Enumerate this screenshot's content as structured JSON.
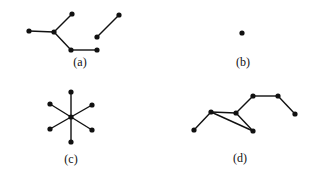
{
  "figure": {
    "panels": [
      {
        "id": "a",
        "label": "(a)",
        "label_pos": [
          80,
          66
        ],
        "nodes": [
          [
            29,
            31
          ],
          [
            54,
            32
          ],
          [
            72,
            14
          ],
          [
            71,
            50
          ],
          [
            97,
            50
          ],
          [
            97,
            37
          ],
          [
            119,
            15
          ]
        ],
        "edges": [
          [
            0,
            1
          ],
          [
            1,
            2
          ],
          [
            1,
            3
          ],
          [
            3,
            4
          ],
          [
            5,
            6
          ]
        ]
      },
      {
        "id": "b",
        "label": "(b)",
        "label_pos": [
          243,
          66
        ],
        "nodes": [
          [
            242,
            33
          ]
        ],
        "edges": []
      },
      {
        "id": "c",
        "label": "(c)",
        "label_pos": [
          71,
          163
        ],
        "nodes": [
          [
            71,
            117
          ],
          [
            71,
            92
          ],
          [
            71,
            142
          ],
          [
            50,
            104
          ],
          [
            92,
            105
          ],
          [
            50,
            129
          ],
          [
            92,
            130
          ]
        ],
        "edges": [
          [
            0,
            1
          ],
          [
            0,
            2
          ],
          [
            0,
            3
          ],
          [
            0,
            4
          ],
          [
            0,
            5
          ],
          [
            0,
            6
          ]
        ]
      },
      {
        "id": "d",
        "label": "(d)",
        "label_pos": [
          240,
          162
        ],
        "nodes": [
          [
            194,
            130
          ],
          [
            211,
            112
          ],
          [
            236,
            113
          ],
          [
            253,
            131
          ],
          [
            253,
            96
          ],
          [
            278,
            96
          ],
          [
            295,
            114
          ]
        ],
        "edges": [
          [
            0,
            1
          ],
          [
            1,
            2
          ],
          [
            1,
            3
          ],
          [
            2,
            3
          ],
          [
            2,
            4
          ],
          [
            4,
            5
          ],
          [
            5,
            6
          ]
        ]
      }
    ]
  }
}
